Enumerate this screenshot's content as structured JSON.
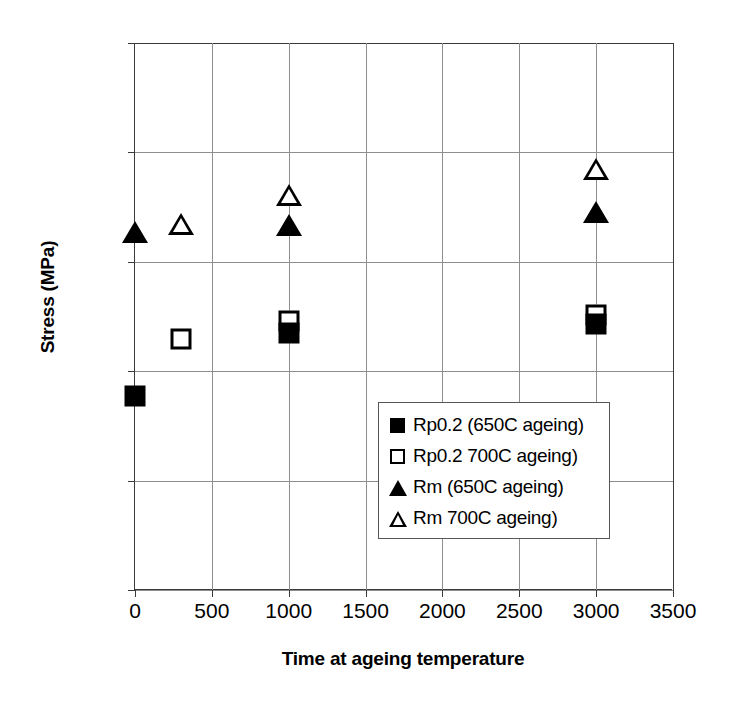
{
  "chart_data": {
    "type": "scatter",
    "title": "",
    "xlabel": "Time at ageing temperature",
    "ylabel": "Stress (MPa)",
    "xlim": [
      0,
      3500
    ],
    "ylim": [
      0,
      1000
    ],
    "xticks": [
      0,
      500,
      1000,
      1500,
      2000,
      2500,
      3000,
      3500
    ],
    "yticks": [
      0,
      200,
      400,
      600,
      800,
      1000
    ],
    "xtick_labels": [
      "0",
      "500",
      "1000",
      "1500",
      "2000",
      "2500",
      "3000",
      "3500"
    ],
    "ytick_labels": [
      "0",
      "200",
      "400",
      "600",
      "800",
      "1000"
    ],
    "grid": true,
    "legend_position": "center-right-inside",
    "series": [
      {
        "name": "Rp0.2 (650C ageing)",
        "marker": "filled-square",
        "color": "#000000",
        "points": [
          {
            "x": 0,
            "y": 355
          },
          {
            "x": 1000,
            "y": 470
          },
          {
            "x": 3000,
            "y": 487
          }
        ]
      },
      {
        "name": "Rp0.2 700C ageing)",
        "marker": "open-square",
        "color": "#000000",
        "points": [
          {
            "x": 300,
            "y": 458
          },
          {
            "x": 1000,
            "y": 492
          },
          {
            "x": 3000,
            "y": 503
          }
        ]
      },
      {
        "name": "Rm (650C ageing)",
        "marker": "filled-triangle",
        "color": "#000000",
        "points": [
          {
            "x": 0,
            "y": 652
          },
          {
            "x": 1000,
            "y": 665
          },
          {
            "x": 3000,
            "y": 690
          }
        ]
      },
      {
        "name": "Rm 700C ageing)",
        "marker": "open-triangle",
        "color": "#000000",
        "points": [
          {
            "x": 300,
            "y": 668
          },
          {
            "x": 1000,
            "y": 720
          },
          {
            "x": 3000,
            "y": 768
          }
        ]
      }
    ]
  },
  "axes": {
    "y_title": "Stress (MPa)",
    "x_title": "Time at ageing temperature"
  },
  "legend": {
    "entries": [
      {
        "label": "Rp0.2 (650C ageing)",
        "marker": "filled-square"
      },
      {
        "label": "Rp0.2 700C ageing)",
        "marker": "open-square"
      },
      {
        "label": "Rm (650C ageing)",
        "marker": "filled-triangle"
      },
      {
        "label": "Rm 700C ageing)",
        "marker": "open-triangle"
      }
    ]
  },
  "colors": {
    "ink": "#000000",
    "grid": "#8e8e8e",
    "axis": "#3a3a3a",
    "background": "#ffffff"
  }
}
